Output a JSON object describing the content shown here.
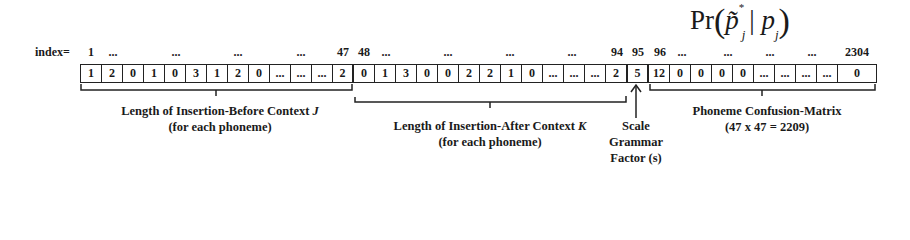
{
  "formula": {
    "prefix": "Pr",
    "expression": "p̃*_j | p_j",
    "display_parts": [
      "Pr",
      "(",
      "p̃",
      "*",
      "j",
      " | ",
      "p",
      "j",
      ")"
    ]
  },
  "index_row": {
    "label": "index=",
    "ticks": [
      {
        "text": "1",
        "x": 91
      },
      {
        "text": "...",
        "x": 113
      },
      {
        "text": "...",
        "x": 176
      },
      {
        "text": "...",
        "x": 238
      },
      {
        "text": "...",
        "x": 301
      },
      {
        "text": "47",
        "x": 343
      },
      {
        "text": "48",
        "x": 364
      },
      {
        "text": "...",
        "x": 386
      },
      {
        "text": "...",
        "x": 448
      },
      {
        "text": "...",
        "x": 510
      },
      {
        "text": "...",
        "x": 572
      },
      {
        "text": "94",
        "x": 617
      },
      {
        "text": "95",
        "x": 638
      },
      {
        "text": "96",
        "x": 660
      },
      {
        "text": "...",
        "x": 682
      },
      {
        "text": "...",
        "x": 728
      },
      {
        "text": "...",
        "x": 770
      },
      {
        "text": "...",
        "x": 812
      },
      {
        "text": "2304",
        "x": 857
      }
    ]
  },
  "cells": [
    {
      "v": "1",
      "w": 21
    },
    {
      "v": "2",
      "w": 21
    },
    {
      "v": "0",
      "w": 21
    },
    {
      "v": "1",
      "w": 21
    },
    {
      "v": "0",
      "w": 21
    },
    {
      "v": "3",
      "w": 21
    },
    {
      "v": "1",
      "w": 21
    },
    {
      "v": "2",
      "w": 21
    },
    {
      "v": "0",
      "w": 21
    },
    {
      "v": "...",
      "w": 21
    },
    {
      "v": "...",
      "w": 21
    },
    {
      "v": "...",
      "w": 21
    },
    {
      "v": "2",
      "w": 21,
      "sep": true
    },
    {
      "v": "0",
      "w": 21
    },
    {
      "v": "1",
      "w": 21
    },
    {
      "v": "3",
      "w": 21
    },
    {
      "v": "0",
      "w": 21
    },
    {
      "v": "0",
      "w": 21
    },
    {
      "v": "2",
      "w": 21
    },
    {
      "v": "2",
      "w": 21
    },
    {
      "v": "1",
      "w": 21
    },
    {
      "v": "0",
      "w": 21
    },
    {
      "v": "...",
      "w": 21
    },
    {
      "v": "...",
      "w": 21
    },
    {
      "v": "...",
      "w": 21
    },
    {
      "v": "2",
      "w": 22,
      "sep": true
    },
    {
      "v": "5",
      "w": 21,
      "sep": true
    },
    {
      "v": "12",
      "w": 21
    },
    {
      "v": "0",
      "w": 21
    },
    {
      "v": "0",
      "w": 21
    },
    {
      "v": "0",
      "w": 21
    },
    {
      "v": "0",
      "w": 21
    },
    {
      "v": "...",
      "w": 21
    },
    {
      "v": "...",
      "w": 21
    },
    {
      "v": "...",
      "w": 21
    },
    {
      "v": "...",
      "w": 21
    },
    {
      "v": "0",
      "w": 38
    }
  ],
  "sections": [
    {
      "name": "Length of Insertion-Before Context",
      "variable": "J",
      "sub": "(for each phoneme)"
    },
    {
      "name": "Length of Insertion-After Context",
      "variable": "K",
      "sub": "(for each phoneme)"
    },
    {
      "lines": [
        "Scale",
        "Grammar",
        "Factor (s)"
      ]
    },
    {
      "name": "Phoneme Confusion-Matrix",
      "sub": "(47 x 47 = 2209)"
    }
  ],
  "colors": {
    "ink": "#1a1a1a",
    "background": "#ffffff"
  }
}
